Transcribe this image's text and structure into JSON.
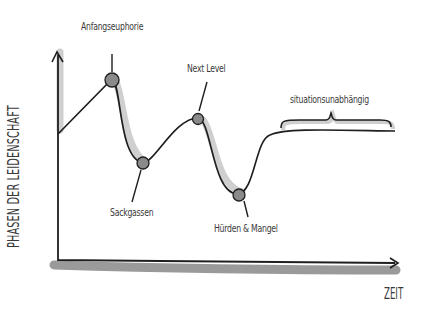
{
  "diagram": {
    "y_axis_label": "PHASEN DER LEIDENSCHAFT",
    "x_axis_label": "ZEIT",
    "phases": [
      {
        "label": "Anfangseuphorie",
        "type": "peak"
      },
      {
        "label": "Sackgassen",
        "type": "trough"
      },
      {
        "label": "Next Level",
        "type": "peak"
      },
      {
        "label": "Hürden & Mangel",
        "type": "trough"
      }
    ],
    "plateau_label": "situationsunabhängig",
    "colors": {
      "line": "#1e1e1e",
      "highlight": "#c8c8c8",
      "dot": "#8a8a8a",
      "axis_shadow": "#9a9a9a",
      "text": "#3a3a3a"
    }
  }
}
